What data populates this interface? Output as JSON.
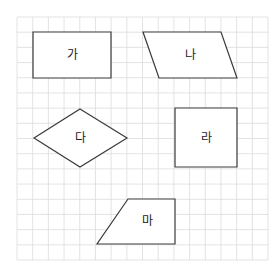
{
  "grid": {
    "left": 17,
    "top": 17,
    "right": 268,
    "bottom": 260,
    "cols": 16,
    "rows": 16,
    "line_color": "#dcdcdc"
  },
  "shapes": [
    {
      "id": "ga",
      "label": "가",
      "type": "rectangle",
      "points": [
        [
          33,
          32
        ],
        [
          111,
          32
        ],
        [
          111,
          78
        ],
        [
          33,
          78
        ]
      ],
      "center": [
        72,
        55
      ]
    },
    {
      "id": "na",
      "label": "나",
      "type": "parallelogram",
      "points": [
        [
          143,
          32
        ],
        [
          221,
          32
        ],
        [
          237,
          78
        ],
        [
          159,
          78
        ]
      ],
      "center": [
        190,
        55
      ]
    },
    {
      "id": "da",
      "label": "다",
      "type": "rhombus",
      "points": [
        [
          80,
          109
        ],
        [
          127,
          138
        ],
        [
          80,
          167
        ],
        [
          34,
          138
        ]
      ],
      "center": [
        80,
        138
      ]
    },
    {
      "id": "ra",
      "label": "라",
      "type": "square",
      "points": [
        [
          175,
          108
        ],
        [
          237,
          108
        ],
        [
          237,
          167
        ],
        [
          175,
          167
        ]
      ],
      "center": [
        206,
        138
      ]
    },
    {
      "id": "ma",
      "label": "마",
      "type": "trapezoid",
      "points": [
        [
          128,
          199
        ],
        [
          175,
          199
        ],
        [
          175,
          244
        ],
        [
          97,
          244
        ]
      ],
      "center": [
        147,
        221
      ]
    }
  ]
}
